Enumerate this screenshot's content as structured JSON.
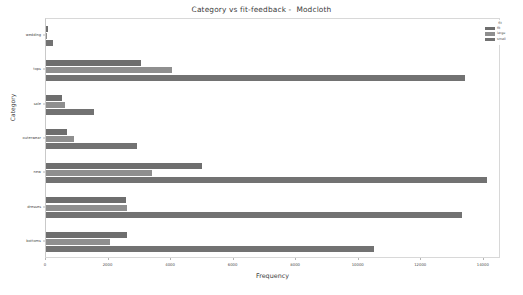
{
  "chart_data": {
    "type": "bar",
    "orientation": "horizontal",
    "title": "Category vs fit-feedback -  Modcloth",
    "xlabel": "Frequency",
    "ylabel": "Category",
    "categories": [
      "wedding",
      "tops",
      "sale",
      "outerwear",
      "new",
      "dresses",
      "bottoms"
    ],
    "series": [
      {
        "name": "fit",
        "color": "#6e6e6e",
        "values": [
          60,
          3050,
          500,
          680,
          5000,
          2550,
          2600
        ]
      },
      {
        "name": "large",
        "color": "#8f8f8f",
        "values": [
          30,
          4030,
          600,
          880,
          3400,
          2600,
          2050
        ]
      },
      {
        "name": "small",
        "color": "#727272",
        "values": [
          210,
          13400,
          1550,
          2900,
          14100,
          13300,
          10500
        ]
      }
    ],
    "xlim": [
      0,
      14550
    ],
    "xticks": [
      0,
      2000,
      4000,
      6000,
      8000,
      10000,
      12000,
      14000
    ],
    "xticklabels": [
      "0",
      "2000",
      "4000",
      "6000",
      "8000",
      "10000",
      "12000",
      "14000"
    ],
    "grid": false,
    "legend": {
      "title": "fit",
      "position": "upper right",
      "entries": [
        "fit",
        "large",
        "small"
      ]
    }
  }
}
